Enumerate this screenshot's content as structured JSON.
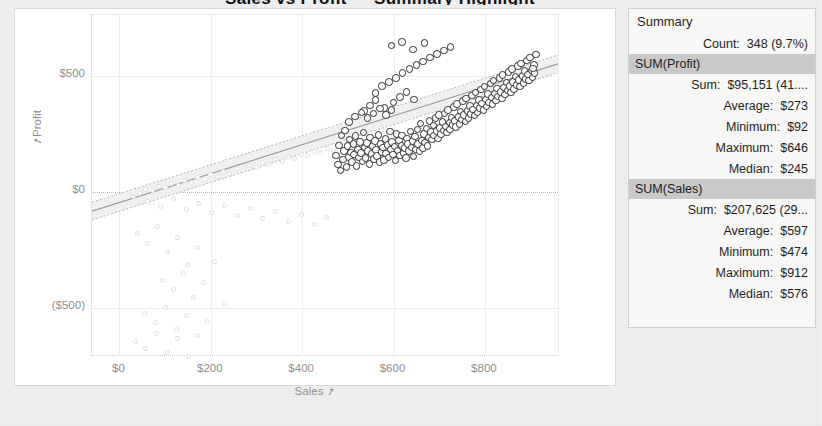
{
  "title_strip": "Sales vs Profit — Summary Highlight",
  "chart_data": {
    "type": "scatter",
    "title": "",
    "xlabel": "Sales",
    "ylabel": "Profit",
    "xlim": [
      -60,
      960
    ],
    "ylim": [
      -700,
      760
    ],
    "xticks": [
      "$0",
      "$200",
      "$400",
      "$600",
      "$800"
    ],
    "xtick_values": [
      0,
      200,
      400,
      600,
      800
    ],
    "yticks": [
      "$500",
      "$0",
      "($500)"
    ],
    "ytick_values": [
      500,
      0,
      -500
    ],
    "grid": true,
    "legend": false,
    "reference_line_y": 0,
    "trend": {
      "type": "linear-with-confidence-band",
      "slope": 0.62,
      "intercept": -45,
      "band_half_width": 38
    },
    "series": [
      {
        "name": "Highlighted (selected)",
        "color": "#2b2b2b",
        "marker": "open-circle",
        "points": [
          [
            474,
            157
          ],
          [
            478,
            118
          ],
          [
            481,
            200
          ],
          [
            484,
            92
          ],
          [
            486,
            243
          ],
          [
            489,
            140
          ],
          [
            492,
            175
          ],
          [
            494,
            265
          ],
          [
            497,
            108
          ],
          [
            499,
            198
          ],
          [
            502,
            150
          ],
          [
            504,
            225
          ],
          [
            507,
            170
          ],
          [
            509,
            128
          ],
          [
            512,
            205
          ],
          [
            514,
            160
          ],
          [
            517,
            240
          ],
          [
            519,
            112
          ],
          [
            522,
            182
          ],
          [
            524,
            148
          ],
          [
            527,
            215
          ],
          [
            529,
            168
          ],
          [
            532,
            130
          ],
          [
            534,
            255
          ],
          [
            537,
            190
          ],
          [
            539,
            145
          ],
          [
            542,
            210
          ],
          [
            544,
            175
          ],
          [
            547,
            120
          ],
          [
            549,
            235
          ],
          [
            552,
            163
          ],
          [
            554,
            198
          ],
          [
            557,
            142
          ],
          [
            559,
            220
          ],
          [
            562,
            180
          ],
          [
            564,
            155
          ],
          [
            567,
            245
          ],
          [
            569,
            128
          ],
          [
            572,
            205
          ],
          [
            574,
            172
          ],
          [
            577,
            190
          ],
          [
            579,
            138
          ],
          [
            582,
            228
          ],
          [
            584,
            165
          ],
          [
            587,
            202
          ],
          [
            589,
            148
          ],
          [
            592,
            260
          ],
          [
            594,
            182
          ],
          [
            597,
            215
          ],
          [
            599,
            160
          ],
          [
            602,
            195
          ],
          [
            604,
            135
          ],
          [
            607,
            248
          ],
          [
            609,
            178
          ],
          [
            612,
            222
          ],
          [
            614,
            156
          ],
          [
            617,
            200
          ],
          [
            619,
            242
          ],
          [
            622,
            168
          ],
          [
            624,
            188
          ],
          [
            627,
            145
          ],
          [
            629,
            230
          ],
          [
            632,
            205
          ],
          [
            634,
            175
          ],
          [
            637,
            260
          ],
          [
            639,
            192
          ],
          [
            642,
            218
          ],
          [
            644,
            152
          ],
          [
            647,
            238
          ],
          [
            649,
            182
          ],
          [
            652,
            268
          ],
          [
            654,
            205
          ],
          [
            657,
            175
          ],
          [
            659,
            295
          ],
          [
            662,
            222
          ],
          [
            664,
            188
          ],
          [
            667,
            250
          ],
          [
            669,
            212
          ],
          [
            672,
            272
          ],
          [
            674,
            198
          ],
          [
            677,
            235
          ],
          [
            679,
            305
          ],
          [
            682,
            258
          ],
          [
            684,
            225
          ],
          [
            687,
            285
          ],
          [
            689,
            242
          ],
          [
            692,
            318
          ],
          [
            694,
            262
          ],
          [
            697,
            230
          ],
          [
            699,
            330
          ],
          [
            702,
            275
          ],
          [
            704,
            248
          ],
          [
            707,
            300
          ],
          [
            709,
            265
          ],
          [
            712,
            338
          ],
          [
            714,
            282
          ],
          [
            717,
            255
          ],
          [
            719,
            352
          ],
          [
            722,
            298
          ],
          [
            724,
            268
          ],
          [
            727,
            320
          ],
          [
            729,
            288
          ],
          [
            732,
            365
          ],
          [
            734,
            305
          ],
          [
            737,
            278
          ],
          [
            739,
            378
          ],
          [
            742,
            322
          ],
          [
            744,
            292
          ],
          [
            747,
            345
          ],
          [
            749,
            312
          ],
          [
            752,
            390
          ],
          [
            754,
            330
          ],
          [
            757,
            302
          ],
          [
            759,
            402
          ],
          [
            762,
            348
          ],
          [
            764,
            318
          ],
          [
            767,
            370
          ],
          [
            769,
            335
          ],
          [
            772,
            415
          ],
          [
            774,
            355
          ],
          [
            777,
            328
          ],
          [
            779,
            428
          ],
          [
            782,
            372
          ],
          [
            784,
            342
          ],
          [
            787,
            395
          ],
          [
            789,
            360
          ],
          [
            792,
            440
          ],
          [
            794,
            380
          ],
          [
            797,
            352
          ],
          [
            799,
            452
          ],
          [
            802,
            398
          ],
          [
            804,
            368
          ],
          [
            807,
            420
          ],
          [
            809,
            385
          ],
          [
            812,
            465
          ],
          [
            814,
            405
          ],
          [
            817,
            378
          ],
          [
            819,
            478
          ],
          [
            822,
            422
          ],
          [
            824,
            392
          ],
          [
            827,
            445
          ],
          [
            829,
            410
          ],
          [
            832,
            490
          ],
          [
            834,
            430
          ],
          [
            837,
            402
          ],
          [
            839,
            502
          ],
          [
            842,
            448
          ],
          [
            844,
            418
          ],
          [
            847,
            470
          ],
          [
            849,
            435
          ],
          [
            852,
            515
          ],
          [
            854,
            455
          ],
          [
            857,
            428
          ],
          [
            859,
            528
          ],
          [
            862,
            472
          ],
          [
            864,
            442
          ],
          [
            867,
            495
          ],
          [
            869,
            460
          ],
          [
            872,
            540
          ],
          [
            874,
            480
          ],
          [
            877,
            452
          ],
          [
            879,
            552
          ],
          [
            882,
            498
          ],
          [
            884,
            468
          ],
          [
            887,
            520
          ],
          [
            889,
            485
          ],
          [
            892,
            565
          ],
          [
            894,
            505
          ],
          [
            897,
            478
          ],
          [
            899,
            578
          ],
          [
            902,
            522
          ],
          [
            904,
            492
          ],
          [
            907,
            545
          ],
          [
            909,
            510
          ],
          [
            912,
            590
          ],
          [
            905,
            530
          ],
          [
            560,
            425
          ],
          [
            575,
            455
          ],
          [
            590,
            472
          ],
          [
            605,
            490
          ],
          [
            620,
            510
          ],
          [
            635,
            528
          ],
          [
            650,
            545
          ],
          [
            665,
            560
          ],
          [
            680,
            578
          ],
          [
            695,
            592
          ],
          [
            710,
            608
          ],
          [
            725,
            622
          ],
          [
            596,
            628
          ],
          [
            618,
            645
          ],
          [
            643,
            612
          ],
          [
            668,
            640
          ],
          [
            535,
            348
          ],
          [
            548,
            372
          ],
          [
            561,
            395
          ],
          [
            580,
            360
          ],
          [
            600,
            385
          ],
          [
            614,
            408
          ],
          [
            628,
            430
          ],
          [
            645,
            398
          ],
          [
            502,
            300
          ],
          [
            516,
            325
          ],
          [
            530,
            342
          ],
          [
            543,
            318
          ],
          [
            556,
            338
          ],
          [
            570,
            358
          ],
          [
            583,
            330
          ],
          [
            596,
            352
          ]
        ]
      },
      {
        "name": "Context (filtered out)",
        "color": "#dedede",
        "marker": "open-circle",
        "points": [
          [
            30,
            -18
          ],
          [
            45,
            -5
          ],
          [
            58,
            12
          ],
          [
            72,
            5
          ],
          [
            86,
            25
          ],
          [
            100,
            18
          ],
          [
            115,
            38
          ],
          [
            129,
            30
          ],
          [
            143,
            50
          ],
          [
            157,
            42
          ],
          [
            171,
            62
          ],
          [
            186,
            55
          ],
          [
            200,
            75
          ],
          [
            214,
            68
          ],
          [
            228,
            88
          ],
          [
            242,
            80
          ],
          [
            256,
            100
          ],
          [
            271,
            92
          ],
          [
            285,
            112
          ],
          [
            299,
            105
          ],
          [
            313,
            125
          ],
          [
            327,
            118
          ],
          [
            341,
            138
          ],
          [
            356,
            130
          ],
          [
            370,
            150
          ],
          [
            384,
            142
          ],
          [
            398,
            162
          ],
          [
            412,
            155
          ],
          [
            426,
            175
          ],
          [
            441,
            168
          ],
          [
            455,
            188
          ],
          [
            469,
            180
          ],
          [
            40,
            -180
          ],
          [
            62,
            -220
          ],
          [
            84,
            -150
          ],
          [
            106,
            -260
          ],
          [
            128,
            -195
          ],
          [
            150,
            -310
          ],
          [
            172,
            -240
          ],
          [
            95,
            -380
          ],
          [
            118,
            -420
          ],
          [
            140,
            -350
          ],
          [
            163,
            -455
          ],
          [
            185,
            -390
          ],
          [
            208,
            -300
          ],
          [
            230,
            -480
          ],
          [
            55,
            -520
          ],
          [
            78,
            -560
          ],
          [
            101,
            -495
          ],
          [
            124,
            -590
          ],
          [
            147,
            -530
          ],
          [
            170,
            -615
          ],
          [
            193,
            -555
          ],
          [
            62,
            -40
          ],
          [
            90,
            -62
          ],
          [
            118,
            -30
          ],
          [
            146,
            -75
          ],
          [
            174,
            -48
          ],
          [
            202,
            -90
          ],
          [
            230,
            -58
          ],
          [
            258,
            -102
          ],
          [
            286,
            -70
          ],
          [
            314,
            -115
          ],
          [
            342,
            -82
          ],
          [
            370,
            -128
          ],
          [
            398,
            -95
          ],
          [
            426,
            -140
          ],
          [
            454,
            -108
          ],
          [
            35,
            -640
          ],
          [
            58,
            -672
          ],
          [
            82,
            -608
          ],
          [
            105,
            -690
          ],
          [
            128,
            -628
          ],
          [
            152,
            -705
          ]
        ]
      }
    ]
  },
  "summary": {
    "panel_title": "Summary",
    "count_label": "Count:",
    "count_value": "348 (9.7%)",
    "groups": [
      {
        "header": "SUM(Profit)",
        "rows": [
          {
            "label": "Sum:",
            "value": "$95,151 (41...."
          },
          {
            "label": "Average:",
            "value": "$273"
          },
          {
            "label": "Minimum:",
            "value": "$92"
          },
          {
            "label": "Maximum:",
            "value": "$646"
          },
          {
            "label": "Median:",
            "value": "$245"
          }
        ]
      },
      {
        "header": "SUM(Sales)",
        "rows": [
          {
            "label": "Sum:",
            "value": "$207,625 (29..."
          },
          {
            "label": "Average:",
            "value": "$597"
          },
          {
            "label": "Minimum:",
            "value": "$474"
          },
          {
            "label": "Maximum:",
            "value": "$912"
          },
          {
            "label": "Median:",
            "value": "$576"
          }
        ]
      }
    ]
  },
  "icons": {
    "sort_glyph": "⇗"
  },
  "colors": {
    "highlight": "#2b2b2b",
    "muted": "#dedede",
    "grid": "#efefef",
    "panel_bg": "#f7f7f5",
    "panel_header": "#c9c9c9"
  }
}
